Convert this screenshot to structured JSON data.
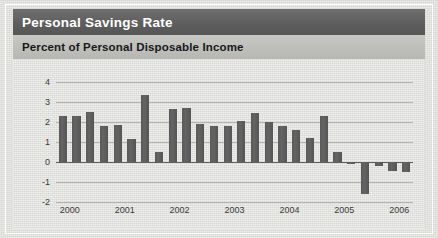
{
  "header": {
    "title": "Personal Savings Rate",
    "subtitle": "Percent of Personal Disposable Income"
  },
  "colors": {
    "title_bar": "#5e5e5e",
    "subtitle_bar": "#bdbdba",
    "bar_fill": "#5a5a5a",
    "gridline": "#b4b4b0",
    "zero_line": "#5f5f5f",
    "panel_background": "#dededb"
  },
  "chart_data": {
    "type": "bar",
    "title": "Personal Savings Rate",
    "subtitle": "Percent of Personal Disposable Income",
    "xlabel": "",
    "ylabel": "Percent of Personal Disposable Income",
    "ylim": [
      -2,
      4
    ],
    "yticks": [
      4,
      3,
      2,
      1,
      0,
      -1,
      -2
    ],
    "ytick_labels": [
      "4",
      "3",
      "2",
      "1",
      "0",
      "-1",
      "-2"
    ],
    "xticks": [
      2000,
      2001,
      2002,
      2003,
      2004,
      2005,
      2006
    ],
    "xtick_labels": [
      "2000",
      "2001",
      "2002",
      "2003",
      "2004",
      "2005",
      "2006"
    ],
    "grid": true,
    "legend": null,
    "legend_position": "none",
    "frequency": "quarterly",
    "categories": [
      "2000 Q1",
      "2000 Q2",
      "2000 Q3",
      "2000 Q4",
      "2001 Q1",
      "2001 Q2",
      "2001 Q3",
      "2001 Q4",
      "2002 Q1",
      "2002 Q2",
      "2002 Q3",
      "2002 Q4",
      "2003 Q1",
      "2003 Q2",
      "2003 Q3",
      "2003 Q4",
      "2004 Q1",
      "2004 Q2",
      "2004 Q3",
      "2004 Q4",
      "2005 Q1",
      "2005 Q2",
      "2005 Q3",
      "2005 Q4",
      "2006 Q1",
      "2006 Q2"
    ],
    "values": [
      2.3,
      2.3,
      2.5,
      1.8,
      1.85,
      1.15,
      3.35,
      0.5,
      2.65,
      2.7,
      1.9,
      1.8,
      1.8,
      2.05,
      2.45,
      2.0,
      1.8,
      1.6,
      1.2,
      2.3,
      0.5,
      -0.1,
      -1.6,
      -0.2,
      -0.45,
      -0.5
    ]
  }
}
